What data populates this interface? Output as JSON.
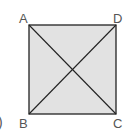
{
  "diagram": {
    "shape": "square",
    "fill": "#e2e2e2",
    "stroke": "#222222",
    "vertices": {
      "A": {
        "label": "A",
        "x": 29,
        "y": 25
      },
      "D": {
        "label": "D",
        "x": 116,
        "y": 25
      },
      "B": {
        "label": "B",
        "x": 29,
        "y": 114
      },
      "C": {
        "label": "C",
        "x": 116,
        "y": 114
      }
    },
    "diagonals": [
      "AC",
      "BD"
    ],
    "fragment": ")"
  }
}
